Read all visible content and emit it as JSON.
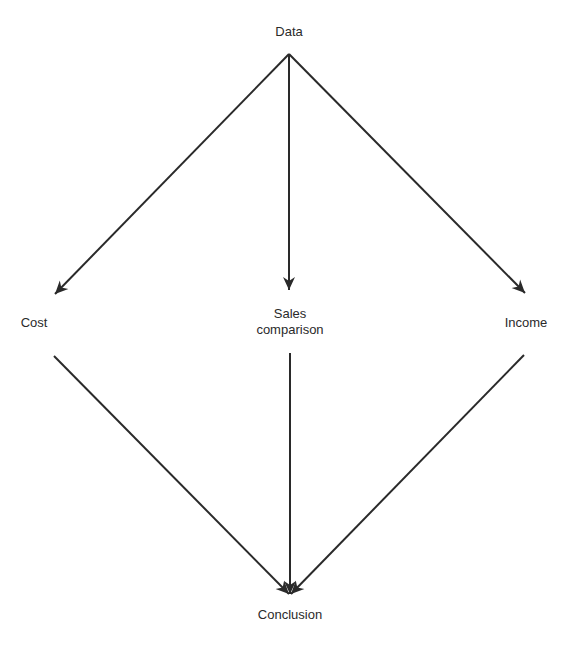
{
  "diagram": {
    "type": "flow",
    "nodes": [
      {
        "id": "data",
        "label": "Data"
      },
      {
        "id": "cost",
        "label": "Cost"
      },
      {
        "id": "sales",
        "label_line1": "Sales",
        "label_line2": "comparison"
      },
      {
        "id": "income",
        "label": "Income"
      },
      {
        "id": "conclusion",
        "label": "Conclusion"
      }
    ],
    "edges": [
      {
        "from": "data",
        "to": "cost"
      },
      {
        "from": "data",
        "to": "sales"
      },
      {
        "from": "data",
        "to": "income"
      },
      {
        "from": "cost",
        "to": "conclusion"
      },
      {
        "from": "sales",
        "to": "conclusion"
      },
      {
        "from": "income",
        "to": "conclusion"
      }
    ],
    "line_color": "#2a2a2a"
  }
}
